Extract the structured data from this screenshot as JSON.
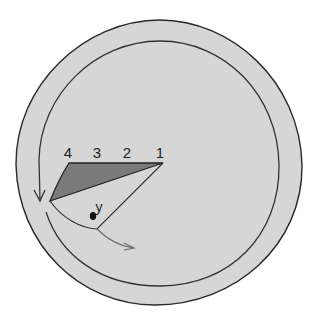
{
  "diagram": {
    "background": "#ffffff",
    "outer_region": {
      "fill": "#d6d6d6",
      "stroke": "#2a2a2a"
    },
    "inner_loop": {
      "stroke": "#333333"
    },
    "dark_wedge": {
      "fill": "#7a7a7a",
      "stroke": "#222222"
    },
    "light_wedge": {
      "stroke": "#333333"
    },
    "flow_arrow": {
      "stroke": "#6e6e6e"
    },
    "labels": {
      "tick_4": "4",
      "tick_3": "3",
      "tick_2": "2",
      "tick_1": "1",
      "point_y": "y"
    },
    "point_y_color": "#111111"
  }
}
